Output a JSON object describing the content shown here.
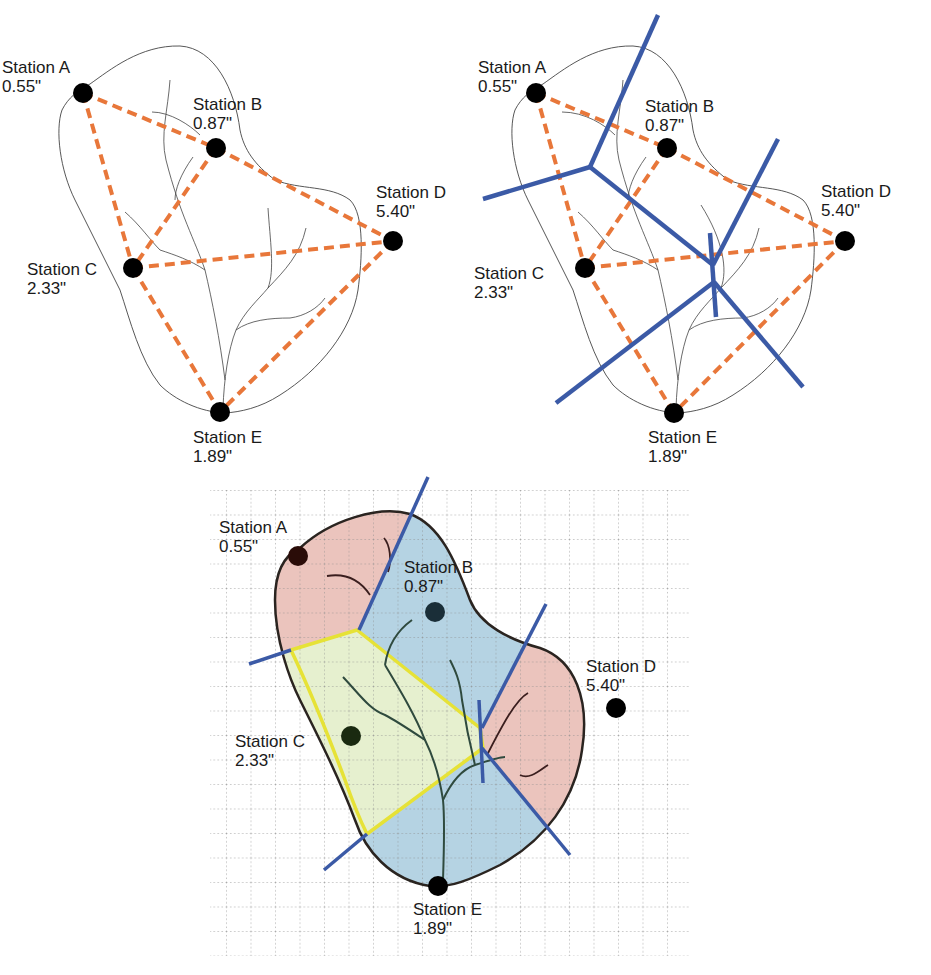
{
  "colors": {
    "outline_thin": "#444444",
    "river_thin": "#444444",
    "triangle_dash": "#e8773a",
    "thiessen_line": "#3b5aa6",
    "station_dot": "#000000",
    "zone_pink": "#ebc4bd",
    "zone_blue": "#b5d3e3",
    "zone_yellow_fill": "#e6f0cf",
    "zone_yellow_border": "#e6e236",
    "outline_thick": "#2a2420",
    "river_thick": "#2f4a3e",
    "grid": "#8a8a8a"
  },
  "panels": [
    {
      "id": "triangulation",
      "title": "Stations connected by triangulation",
      "stations": [
        {
          "name": "Station A",
          "value": "0.55\"",
          "x": 83,
          "y": 93,
          "label_x": 2,
          "label_y": 58
        },
        {
          "name": "Station B",
          "value": "0.87\"",
          "x": 216,
          "y": 148,
          "label_x": 193,
          "label_y": 95
        },
        {
          "name": "Station C",
          "value": "2.33\"",
          "x": 133,
          "y": 268,
          "label_x": 27,
          "label_y": 260
        },
        {
          "name": "Station D",
          "value": "5.40\"",
          "x": 393,
          "y": 241,
          "label_x": 376,
          "label_y": 183
        },
        {
          "name": "Station E",
          "value": "1.89\"",
          "x": 220,
          "y": 412,
          "label_x": 193,
          "label_y": 428
        }
      ]
    },
    {
      "id": "thiessen-construction",
      "title": "Perpendicular bisectors (Thiessen lines)",
      "stations": [
        {
          "name": "Station A",
          "value": "0.55\"",
          "x": 536,
          "y": 93,
          "label_x": 478,
          "label_y": 58
        },
        {
          "name": "Station B",
          "value": "0.87\"",
          "x": 667,
          "y": 148,
          "label_x": 645,
          "label_y": 97
        },
        {
          "name": "Station C",
          "value": "2.33\"",
          "x": 585,
          "y": 268,
          "label_x": 474,
          "label_y": 264
        },
        {
          "name": "Station D",
          "value": "5.40\"",
          "x": 845,
          "y": 241,
          "label_x": 821,
          "label_y": 182
        },
        {
          "name": "Station E",
          "value": "1.89\"",
          "x": 674,
          "y": 413,
          "label_x": 648,
          "label_y": 428
        }
      ]
    },
    {
      "id": "thiessen-polygons",
      "title": "Thiessen polygons over grid",
      "stations": [
        {
          "name": "Station A",
          "value": "0.55\"",
          "x": 298,
          "y": 556,
          "label_x": 219,
          "label_y": 518
        },
        {
          "name": "Station B",
          "value": "0.87\"",
          "x": 435,
          "y": 612,
          "label_x": 404,
          "label_y": 558
        },
        {
          "name": "Station C",
          "value": "2.33\"",
          "x": 351,
          "y": 736,
          "label_x": 235,
          "label_y": 732
        },
        {
          "name": "Station D",
          "value": "5.40\"",
          "x": 616,
          "y": 708,
          "label_x": 586,
          "label_y": 657
        },
        {
          "name": "Station E",
          "value": "1.89\"",
          "x": 438,
          "y": 886,
          "label_x": 413,
          "label_y": 900
        }
      ],
      "zones": [
        {
          "station": "Station A",
          "color": "pink"
        },
        {
          "station": "Station B",
          "color": "blue"
        },
        {
          "station": "Station C",
          "color": "yellow"
        },
        {
          "station": "Station D",
          "color": "pink"
        },
        {
          "station": "Station E",
          "color": "blue"
        }
      ],
      "grid": {
        "x0": 226,
        "y0": 490,
        "x1": 690,
        "y1": 955,
        "step": 24.5
      }
    }
  ],
  "triangulation_edges": [
    [
      "A",
      "B"
    ],
    [
      "A",
      "C"
    ],
    [
      "B",
      "C"
    ],
    [
      "B",
      "D"
    ],
    [
      "C",
      "D"
    ],
    [
      "C",
      "E"
    ],
    [
      "D",
      "E"
    ]
  ]
}
